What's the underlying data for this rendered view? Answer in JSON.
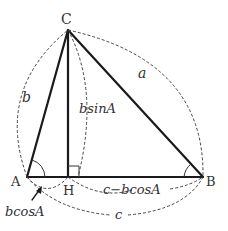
{
  "diagram": {
    "vertices": {
      "A": {
        "label": "A",
        "x": 27,
        "y": 177
      },
      "B": {
        "label": "B",
        "x": 203,
        "y": 177
      },
      "C": {
        "label": "C",
        "x": 68,
        "y": 30
      },
      "H": {
        "label": "H",
        "x": 68,
        "y": 177
      }
    },
    "labels": {
      "side_a": "a",
      "side_b": "b",
      "side_c": "c",
      "altitude": "bsinA",
      "segment_HB": "c−bcosA",
      "segment_AH": "bcosA"
    },
    "colors": {
      "line": "#1a1a1a",
      "dashed": "#444444",
      "text": "#333333",
      "background": "#ffffff"
    }
  }
}
